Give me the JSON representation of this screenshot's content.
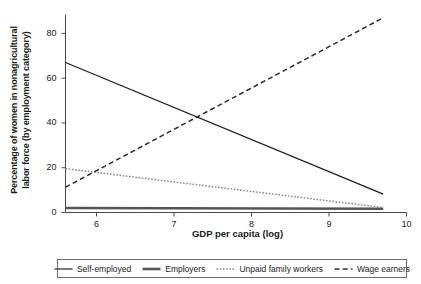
{
  "chart_data": {
    "type": "line",
    "title": "",
    "xlabel": "GDP per capita (log)",
    "ylabel_line1": "Percentage of women in nonagricultural",
    "ylabel_line2": "labor force (by employment category)",
    "xlim": [
      5.6,
      10.0
    ],
    "ylim": [
      0,
      88
    ],
    "xticks": [
      6,
      7,
      8,
      9,
      10
    ],
    "xtick_labels": [
      "6",
      "7",
      "8",
      "9",
      "10"
    ],
    "yticks": [
      0,
      20,
      40,
      60,
      80
    ],
    "ytick_labels": [
      "0",
      "20",
      "40",
      "60",
      "80"
    ],
    "grid": false,
    "legend_position": "below-axes",
    "series": [
      {
        "name": "Self-employed",
        "style": "solid-thin",
        "color": "#1a1a1a",
        "x": [
          5.6,
          9.7
        ],
        "values": [
          67.0,
          8.2
        ]
      },
      {
        "name": "Employers",
        "style": "solid-thick",
        "color": "#555555",
        "x": [
          5.6,
          9.7
        ],
        "values": [
          2.0,
          1.7
        ]
      },
      {
        "name": "Unpaid family workers",
        "style": "dotted",
        "color": "#8a8a8a",
        "x": [
          5.6,
          9.7
        ],
        "values": [
          19.6,
          2.2
        ]
      },
      {
        "name": "Wage earners",
        "style": "dashed",
        "color": "#2b2b35",
        "x": [
          5.6,
          9.7
        ],
        "values": [
          11.3,
          87.0
        ]
      }
    ]
  },
  "legend": {
    "items": [
      {
        "label": "Self-employed"
      },
      {
        "label": "Employers"
      },
      {
        "label": "Unpaid family workers"
      },
      {
        "label": "Wage earners"
      }
    ]
  }
}
